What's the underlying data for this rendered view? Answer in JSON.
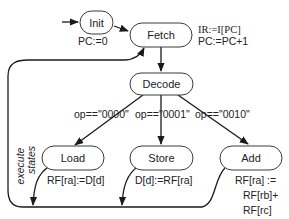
{
  "diagram": {
    "states": {
      "init": {
        "label": "Init",
        "action": "PC:=0"
      },
      "fetch": {
        "label": "Fetch",
        "action_lines": [
          "IR:=I[PC]",
          "PC:=PC+1"
        ]
      },
      "decode": {
        "label": "Decode"
      },
      "load": {
        "label": "Load",
        "action": "RF[ra]:=D[d]"
      },
      "store": {
        "label": "Store",
        "action": "D[d]:=RF[ra]"
      },
      "add": {
        "label": "Add",
        "action_lines": [
          "RF[ra] :=",
          "RF[rb]+",
          "RF[rc]"
        ]
      }
    },
    "transitions": {
      "to_load": "op==\"0000\"",
      "to_store": "op==\"0001\"",
      "to_add": "op==\"0010\""
    },
    "group_label_lines": [
      "execute",
      "states"
    ],
    "colors": {
      "stroke": "#1a1a1a",
      "node_border": "#3a3a3a",
      "background": "#ffffff"
    }
  }
}
